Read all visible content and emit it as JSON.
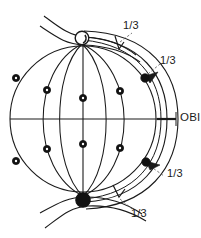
{
  "figure": {
    "canvas": {
      "width": 201,
      "height": 238,
      "background": "#ffffff"
    },
    "stroke_color": "#1a1a1a",
    "marker_fill": "#111111",
    "marker_hollow_fill": "#ffffff"
  },
  "labels": {
    "obi": "OBI",
    "fraction_top": "1/3",
    "fraction_upper_right": "1/3",
    "fraction_lower_right": "1/3",
    "fraction_bottom": "1/3"
  },
  "geometry": {
    "sphere": {
      "cx": 83,
      "cy": 119,
      "r": 73
    },
    "outer_arc_right_x": 172,
    "equator_y": 119,
    "pole_top": {
      "cx": 82,
      "cy": 38,
      "r": 7,
      "type": "hollow"
    },
    "pole_bottom": {
      "cx": 83,
      "cy": 200,
      "r": 7,
      "type": "filled"
    },
    "obi_tick": {
      "x1": 157,
      "x2": 176,
      "y": 119
    }
  },
  "markers": [
    {
      "id": "m-left-upper",
      "cx": 16,
      "cy": 78
    },
    {
      "id": "m-left-lower",
      "cx": 16,
      "cy": 161
    },
    {
      "id": "m-mid-left-upper",
      "cx": 47,
      "cy": 90
    },
    {
      "id": "m-mid-left-lower",
      "cx": 47,
      "cy": 149
    },
    {
      "id": "m-center-upper",
      "cx": 83,
      "cy": 98
    },
    {
      "id": "m-center-lower",
      "cx": 83,
      "cy": 144
    },
    {
      "id": "m-mid-right-upper",
      "cx": 120,
      "cy": 91
    },
    {
      "id": "m-mid-right-lower",
      "cx": 120,
      "cy": 148
    },
    {
      "id": "m-right-upper",
      "cx": 145,
      "cy": 78
    },
    {
      "id": "m-right-lower",
      "cx": 146,
      "cy": 162
    }
  ],
  "label_positions": {
    "obi": {
      "left": 180,
      "top": 112
    },
    "fraction_top": {
      "left": 123,
      "top": 20
    },
    "fraction_upper_right": {
      "left": 160,
      "top": 55
    },
    "fraction_lower_right": {
      "left": 167,
      "top": 168
    },
    "fraction_bottom": {
      "left": 131,
      "top": 208
    }
  }
}
